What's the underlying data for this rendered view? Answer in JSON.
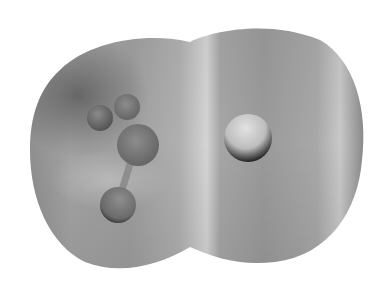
{
  "figure": {
    "background": "#ffffff",
    "surface": {
      "base_color": "#9a9a9a",
      "dark_region_color": "#6e6e6e",
      "highlight_color": "#d2d2d2"
    },
    "atoms": [
      {
        "name": "central-carbon",
        "cx": 138,
        "cy": 145,
        "r": 21,
        "color": "#7a7a7a"
      },
      {
        "name": "hydrogen-upper-left",
        "cx": 100,
        "cy": 118,
        "r": 13,
        "color": "#6a6a6a"
      },
      {
        "name": "hydrogen-upper",
        "cx": 127,
        "cy": 107,
        "r": 13,
        "color": "#7c7c7c"
      },
      {
        "name": "hydrogen-lower",
        "cx": 118,
        "cy": 205,
        "r": 18,
        "color": "#7a7a7a"
      },
      {
        "name": "halogen-right",
        "cx": 248,
        "cy": 138,
        "r": 24,
        "color": "#c4c4c4"
      }
    ],
    "bonds": [
      {
        "name": "bond-carbon-halogen",
        "x1": 156,
        "y1": 146,
        "x2": 228,
        "y2": 146,
        "width": 9
      },
      {
        "name": "bond-carbon-hydrogen-lower",
        "x1": 130,
        "y1": 164,
        "x2": 122,
        "y2": 190,
        "width": 7
      }
    ]
  }
}
